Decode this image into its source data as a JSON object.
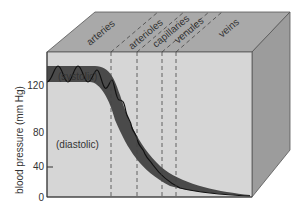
{
  "diagram": {
    "vessel_labels": [
      "arteries",
      "arterioles",
      "capillaries",
      "venules",
      "veins"
    ],
    "curve_labels": {
      "systolic": "(systolic)",
      "diastolic": "(diastolic)"
    },
    "y_axis": {
      "label": "blood pressure (mm Hg)",
      "ticks": [
        "0",
        "40",
        "80",
        "120"
      ]
    },
    "colors": {
      "top_face": "#a9a9a9",
      "front_face": "#d6d6d6",
      "right_face": "#9c9c9c",
      "pulse_band": "#4a4a4a",
      "curve": "#111111"
    }
  }
}
